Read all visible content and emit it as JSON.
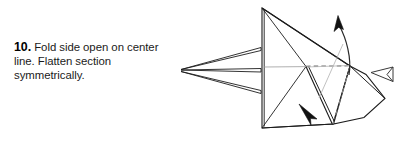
{
  "page": {
    "width": 411,
    "height": 143,
    "background_color": "#ffffff",
    "kind": "origami-instruction-step"
  },
  "instruction": {
    "step_number": "10.",
    "body_text": "Fold side open on center line.  Flatten section symmetrically.",
    "full_text": "10. Fold side open on center line.  Flatten section symmetrically.",
    "text_color": "#1a1a1a",
    "number_color": "#000000"
  },
  "diagram": {
    "stroke_color": "#1c1c1c",
    "fold_line_color": "#8a8a8a",
    "fill_color": "#ffffff",
    "annotations": [
      {
        "name": "unfold-arrow-up",
        "style": "solid-filled-arrowhead",
        "direction": "up",
        "meaning": "open-flap-upward"
      },
      {
        "name": "fold-arrow-down",
        "style": "solid-filled-arrowhead",
        "direction": "down-right",
        "meaning": "flatten-section"
      },
      {
        "name": "push-arrow-hollow",
        "style": "hollow-outlined-arrowhead",
        "direction": "left",
        "meaning": "push-in"
      }
    ],
    "line_types": {
      "solid": "cut-or-edge",
      "dashed": "valley-fold",
      "dash_dot": "hidden-edge"
    }
  }
}
